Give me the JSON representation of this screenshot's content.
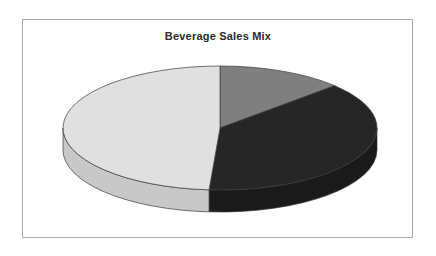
{
  "chart_title": "Beverage Sales Mix",
  "frame": {
    "border_color": "#a9a9a9",
    "background": "#ffffff"
  },
  "chart_data": {
    "type": "pie",
    "title": "Beverage Sales Mix",
    "subtitle": "",
    "xlabel": "",
    "ylabel": "",
    "legend": "none",
    "grid": false,
    "three_d": true,
    "start_angle_deg": 0,
    "direction": "clockwise",
    "categories": [
      "Slice 1",
      "Slice 2",
      "Slice 3"
    ],
    "values": [
      13,
      38,
      49
    ],
    "colors": [
      "#7f7f7f",
      "#262626",
      "#e0e0e0"
    ],
    "slices": [
      {
        "label": "Slice 1",
        "value": 13,
        "percent": 13,
        "color": "#7f7f7f",
        "side_color": "#5e5e5e",
        "start_deg": 0,
        "end_deg": 47
      },
      {
        "label": "Slice 2",
        "value": 38,
        "percent": 38,
        "color": "#262626",
        "side_color": "#1a1a1a",
        "start_deg": 47,
        "end_deg": 184
      },
      {
        "label": "Slice 3",
        "value": 49,
        "percent": 49,
        "color": "#e0e0e0",
        "side_color": "#c8c8c8",
        "start_deg": 184,
        "end_deg": 360
      }
    ],
    "geometry": {
      "center_x": 220,
      "center_y": 128,
      "radius_x": 157,
      "radius_y": 62,
      "depth": 22
    }
  }
}
